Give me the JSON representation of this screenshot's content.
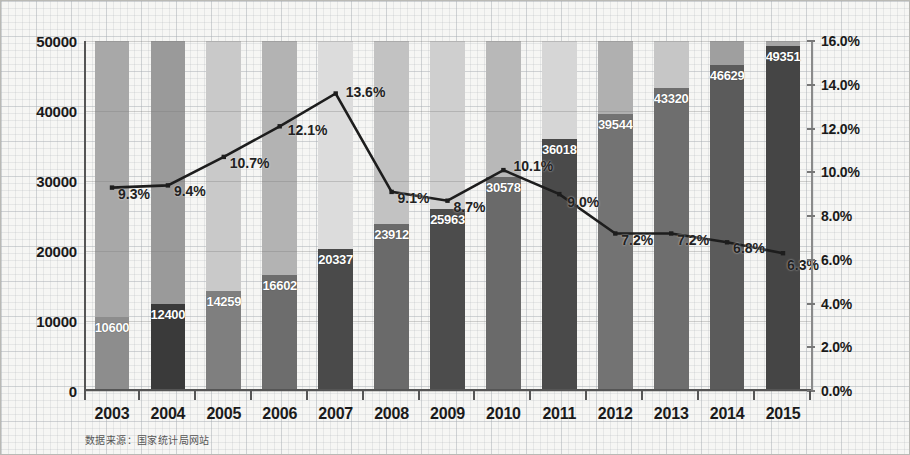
{
  "chart_data": {
    "type": "bar",
    "title": "",
    "subtitle": "",
    "xlabel": "",
    "ylabel": "",
    "y2label": "",
    "grid": true,
    "legend": "none",
    "categories": [
      "2003",
      "2004",
      "2005",
      "2006",
      "2007",
      "2008",
      "2009",
      "2010",
      "2011",
      "2012",
      "2013",
      "2014",
      "2015"
    ],
    "series": [
      {
        "name": "金额",
        "type": "bar",
        "axis": "left",
        "values": [
          10600,
          12400,
          14259,
          16602,
          20337,
          23912,
          25963,
          30578,
          36018,
          39544,
          43320,
          46629,
          49351
        ],
        "labels": [
          "10600",
          "12400",
          "14259",
          "16602",
          "20337",
          "23912",
          "25963",
          "30578",
          "36018",
          "39544",
          "43320",
          "46629",
          "49351"
        ]
      },
      {
        "name": "增长率",
        "type": "line",
        "axis": "right",
        "values": [
          9.3,
          9.4,
          10.7,
          12.1,
          13.6,
          9.1,
          8.7,
          10.1,
          9.0,
          7.2,
          7.2,
          6.8,
          6.3
        ],
        "labels": [
          "9.3%",
          "9.4%",
          "10.7%",
          "12.1%",
          "13.6%",
          "9.1%",
          "8.7%",
          "10.1%",
          "9.0%",
          "7.2%",
          "7.2%",
          "6.8%",
          "6.3%"
        ]
      }
    ],
    "ylim": [
      0,
      50000
    ],
    "yticks": [
      "0",
      "10000",
      "20000",
      "30000",
      "40000",
      "50000"
    ],
    "ytick_values": [
      0,
      10000,
      20000,
      30000,
      40000,
      50000
    ],
    "y2lim": [
      0,
      16
    ],
    "y2ticks": [
      "0.0%",
      "2.0%",
      "4.0%",
      "6.0%",
      "8.0%",
      "10.0%",
      "12.0%",
      "14.0%",
      "16.0%"
    ],
    "y2tick_values": [
      0,
      2,
      4,
      6,
      8,
      10,
      12,
      14,
      16
    ],
    "bar_shades": [
      "#8d8d8d",
      "#3a3a3a",
      "#7f7f7f",
      "#6d6d6d",
      "#4a4a4a",
      "#6a6a6a",
      "#4c4c4c",
      "#6a6a6a",
      "#4a4a4a",
      "#737373",
      "#6e6e6e",
      "#5b5b5b",
      "#454545"
    ],
    "band_shades": [
      "#a8a8a8",
      "#9a9a9a",
      "#c9c9c9",
      "#b3b3b3",
      "#dcdcdc",
      "#c2c2c2",
      "#cfcfcf",
      "#b8b8b8",
      "#d6d6d6",
      "#b0b0b0",
      "#c6c6c6",
      "#9f9f9f",
      "#a6a6a6"
    ],
    "line_color": "#1d1d1d",
    "label_color": "#ffffff",
    "axis_color": "#555555"
  },
  "footer": {
    "source": "数据来源：国家统计局网站"
  }
}
